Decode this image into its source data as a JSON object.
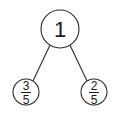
{
  "diagram": {
    "type": "number-bond",
    "whole": {
      "label": "1"
    },
    "parts": [
      {
        "numerator": "3",
        "denominator": "5"
      },
      {
        "numerator": "2",
        "denominator": "5"
      }
    ],
    "colors": {
      "stroke": "#2a2a2a",
      "text": "#1a1a1a",
      "background": "#ffffff"
    }
  }
}
